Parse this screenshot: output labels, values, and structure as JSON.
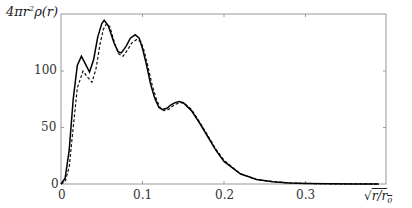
{
  "chart_data": {
    "type": "line",
    "title": "",
    "xlabel": "√(r/r₀)",
    "ylabel": "4πr²ρ(r)",
    "xlim": [
      0,
      0.39
    ],
    "ylim": [
      0,
      150
    ],
    "xticks": [
      "0",
      "0.1",
      "0.2",
      "0.3"
    ],
    "yticks": [
      "0",
      "50",
      "100"
    ],
    "grid": false,
    "legend": null,
    "series": [
      {
        "name": "solid",
        "style": "solid",
        "x": [
          0,
          0.005,
          0.01,
          0.015,
          0.02,
          0.025,
          0.03,
          0.035,
          0.04,
          0.045,
          0.05,
          0.053,
          0.058,
          0.065,
          0.07,
          0.074,
          0.08,
          0.085,
          0.091,
          0.096,
          0.1,
          0.105,
          0.11,
          0.115,
          0.12,
          0.124,
          0.13,
          0.135,
          0.14,
          0.145,
          0.15,
          0.16,
          0.17,
          0.18,
          0.19,
          0.2,
          0.22,
          0.24,
          0.26,
          0.28,
          0.3,
          0.33,
          0.36,
          0.39
        ],
        "y": [
          0,
          5,
          30,
          75,
          105,
          113,
          106,
          99,
          110,
          130,
          142,
          145,
          140,
          125,
          117,
          116,
          122,
          129,
          132,
          129,
          120,
          105,
          88,
          76,
          68,
          66,
          67,
          70,
          72,
          73,
          72,
          65,
          54,
          42,
          30,
          20,
          9,
          4,
          2,
          1,
          0.5,
          0.2,
          0.1,
          0
        ]
      },
      {
        "name": "dashed",
        "style": "dashed",
        "x": [
          0,
          0.005,
          0.01,
          0.015,
          0.02,
          0.027,
          0.032,
          0.038,
          0.043,
          0.048,
          0.052,
          0.056,
          0.06,
          0.066,
          0.071,
          0.076,
          0.082,
          0.087,
          0.093,
          0.098,
          0.102,
          0.107,
          0.112,
          0.117,
          0.122,
          0.126,
          0.132,
          0.137,
          0.142,
          0.147,
          0.152,
          0.16,
          0.17,
          0.18,
          0.19,
          0.2,
          0.22,
          0.24,
          0.26,
          0.28,
          0.3,
          0.33,
          0.36,
          0.39
        ],
        "y": [
          0,
          2,
          15,
          50,
          85,
          100,
          95,
          90,
          102,
          124,
          137,
          142,
          139,
          124,
          115,
          113,
          119,
          125,
          128,
          126,
          118,
          103,
          87,
          75,
          67,
          65,
          66,
          69,
          71,
          72,
          71,
          66,
          55,
          43,
          31,
          21,
          9,
          4,
          2,
          1,
          0.5,
          0.2,
          0.1,
          0
        ]
      }
    ]
  },
  "axes": {
    "ylabel": "4πr²ρ(r)",
    "xlabel": "√(r/r₀)",
    "yticks": [
      "100",
      "50",
      "0"
    ],
    "xticks": [
      "0",
      "0.1",
      "0.2",
      "0.3"
    ]
  }
}
